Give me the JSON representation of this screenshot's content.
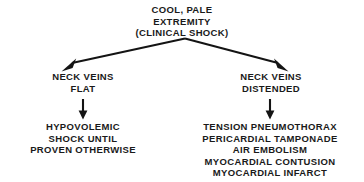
{
  "diagram": {
    "title_node": {
      "name": "clinical-shock-root",
      "lines": [
        "COOL, PALE",
        "EXTREMITY",
        "(CLINICAL SHOCK)"
      ]
    },
    "branches": [
      {
        "name": "neck-veins-flat",
        "condition_lines": [
          "NECK VEINS",
          "FLAT"
        ],
        "outcome_lines": [
          "HYPOVOLEMIC",
          "SHOCK UNTIL",
          "PROVEN OTHERWISE"
        ]
      },
      {
        "name": "neck-veins-distended",
        "condition_lines": [
          "NECK VEINS",
          "DISTENDED"
        ],
        "outcome_lines": [
          "TENSION PNEUMOTHORAX",
          "PERICARDIAL TAMPONADE",
          "AIR EMBOLISM",
          "MYOCARDIAL CONTUSION",
          "MYOCARDIAL INFARCT"
        ]
      }
    ],
    "colors": {
      "background": "#ffffff",
      "text": "#1a1a1a",
      "connector": "#141414"
    }
  }
}
